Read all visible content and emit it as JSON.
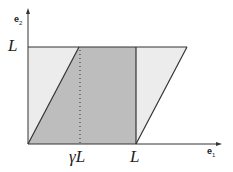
{
  "diagram": {
    "type": "shear-deformation",
    "axes": {
      "x_label": "e",
      "x_sub": "1",
      "y_label": "e",
      "y_sub": "2"
    },
    "tick_labels": {
      "y_top": "L",
      "x_gamma": "γL",
      "x_L": "L"
    },
    "colors": {
      "original_square_fill": "#b8b8b8",
      "sheared_fill": "#e8e8e8",
      "stroke": "#333333"
    }
  }
}
